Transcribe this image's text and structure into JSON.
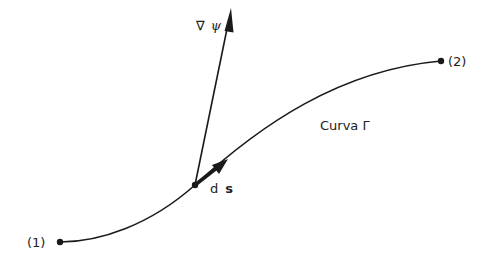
{
  "diagram": {
    "type": "curve-with-vectors",
    "points": {
      "start": {
        "label": "(1)",
        "x": 60,
        "y": 242
      },
      "mid": {
        "label": "ds",
        "x": 195,
        "y": 185
      },
      "end": {
        "label": "(2)",
        "x": 441,
        "y": 61
      }
    },
    "curve": {
      "label": "Curva Γ"
    },
    "vectors": {
      "gradient": {
        "label_symbol": "∇",
        "label_var": "ψ"
      },
      "tangent": {
        "label_d": "d",
        "label_s": "s"
      }
    },
    "colors": {
      "stroke": "#1a1a1a",
      "background": "#ffffff"
    }
  }
}
